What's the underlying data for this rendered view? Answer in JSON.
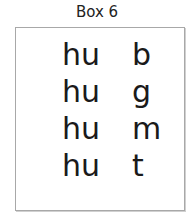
{
  "title": "Box 6",
  "rows": [
    {
      "onset": "hu",
      "coda": "b"
    },
    {
      "onset": "hu",
      "coda": "g"
    },
    {
      "onset": "hu",
      "coda": "m"
    },
    {
      "onset": "hu",
      "coda": "t"
    }
  ]
}
